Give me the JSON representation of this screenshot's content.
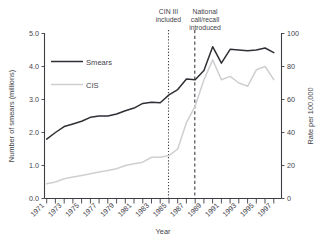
{
  "chart_data": {
    "type": "line",
    "title": "",
    "xlabel": "Year",
    "ylabel": "Number of smears (millions)",
    "y2label": "Rate per 100,000",
    "grid": false,
    "legend_position": "inside-top-left",
    "x": [
      1971,
      1972,
      1973,
      1974,
      1975,
      1976,
      1977,
      1978,
      1979,
      1980,
      1981,
      1982,
      1983,
      1984,
      1985,
      1986,
      1987,
      1988,
      1989,
      1990,
      1991,
      1992,
      1993,
      1994,
      1995,
      1996,
      1997
    ],
    "xlim": [
      1971,
      1998
    ],
    "ylim": [
      0.0,
      5.0
    ],
    "y2lim": [
      0,
      100
    ],
    "yticks": [
      "0.0",
      "1.0",
      "2.0",
      "3.0",
      "4.0",
      "5.0"
    ],
    "ytick_values": [
      0.0,
      1.0,
      2.0,
      3.0,
      4.0,
      5.0
    ],
    "y2ticks": [
      "0",
      "20",
      "40",
      "60",
      "80",
      "100"
    ],
    "y2tick_values": [
      0,
      20,
      40,
      60,
      80,
      100
    ],
    "xticks_labeled": [
      "1971",
      "1973",
      "1975",
      "1977",
      "1979",
      "1981",
      "1983",
      "1985",
      "1987",
      "1989",
      "1991",
      "1993",
      "1995",
      "1997"
    ],
    "xtick_values_labeled": [
      1971,
      1973,
      1975,
      1977,
      1979,
      1981,
      1983,
      1985,
      1987,
      1989,
      1991,
      1993,
      1995,
      1997
    ],
    "series": [
      {
        "name": "Smears",
        "axis": "left",
        "color": "#2f2f35",
        "units": "millions",
        "values": [
          1.8,
          2.0,
          2.18,
          2.26,
          2.34,
          2.46,
          2.5,
          2.5,
          2.56,
          2.66,
          2.74,
          2.88,
          2.92,
          2.9,
          3.14,
          3.3,
          3.62,
          3.6,
          3.88,
          4.6,
          4.1,
          4.52,
          4.5,
          4.48,
          4.5,
          4.56,
          4.42
        ]
      },
      {
        "name": "CIS",
        "axis": "right",
        "color": "#cfcfd2",
        "units": "rate per 100,000",
        "values": [
          9,
          10,
          12,
          13,
          14,
          15,
          16,
          17,
          18,
          20,
          21,
          22,
          25,
          25,
          26,
          30,
          46,
          56,
          72,
          84,
          72,
          74,
          70,
          68,
          78,
          80,
          72
        ]
      }
    ],
    "annotations": [
      {
        "id": "cin3",
        "text_lines": [
          "CIN III",
          "included"
        ],
        "x": 1985,
        "line_style": "dotted"
      },
      {
        "id": "call-recall",
        "text_lines": [
          "National",
          "call/recall",
          "introduced"
        ],
        "x": 1988,
        "line_style": "dashed"
      }
    ]
  },
  "legend": {
    "items": [
      {
        "label": "Smears"
      },
      {
        "label": "CIS"
      }
    ]
  },
  "axes": {
    "left": {
      "title": "Number of smears (millions)"
    },
    "right": {
      "title": "Rate per 100,000"
    },
    "bottom": {
      "title": "Year"
    }
  },
  "annotations": {
    "cin3": {
      "line1": "CIN III",
      "line2": "included"
    },
    "call_recall": {
      "line1": "National",
      "line2": "call/recall",
      "line3": "introduced"
    }
  },
  "yticks": {
    "t0": "0.0",
    "t1": "1.0",
    "t2": "2.0",
    "t3": "3.0",
    "t4": "4.0",
    "t5": "5.0"
  },
  "y2ticks": {
    "t0": "0",
    "t1": "20",
    "t2": "40",
    "t3": "60",
    "t4": "80",
    "t5": "100"
  },
  "xticks": {
    "t1971": "1971",
    "t1973": "1973",
    "t1975": "1975",
    "t1977": "1977",
    "t1979": "1979",
    "t1981": "1981",
    "t1983": "1983",
    "t1985": "1985",
    "t1987": "1987",
    "t1989": "1989",
    "t1991": "1991",
    "t1993": "1993",
    "t1995": "1995",
    "t1997": "1997"
  }
}
